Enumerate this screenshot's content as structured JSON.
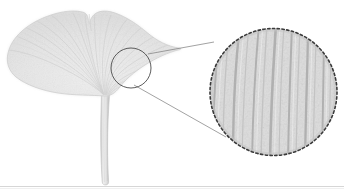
{
  "figure": {
    "caption": "Fan-shaped ginkgo leaf specimen on white background with a circular callout magnifying the dichotomous parallel venation.",
    "background_color": "#ffffff",
    "width": 344,
    "height": 194
  },
  "specimen": {
    "name": "ginkgo-leaf",
    "common_name": "Ginkgo leaf",
    "blade_fill": "#e4e4e4",
    "blade_fill_light": "#efefef",
    "blade_edge_color": "#c9c9c9",
    "vein_color": "#c4c4c4",
    "vein_color_soft": "#d4d4d4",
    "petiole_fill": "#e0e0e0",
    "petiole_edge": "#b9b9b9",
    "blade_bounds": {
      "x": 6,
      "y": 10,
      "width": 176,
      "height": 92
    },
    "petiole_bounds": {
      "x": 96,
      "y": 92,
      "width": 18,
      "height": 93
    }
  },
  "callout": {
    "source_marker": {
      "name": "detail-source-circle",
      "cx": 131,
      "cy": 68,
      "r": 20,
      "stroke": "#4a4a4a",
      "stroke_width": 0.9,
      "fill": "none"
    },
    "magnifier": {
      "name": "magnified-detail-circle",
      "cx": 273.5,
      "cy": 92,
      "r": 64,
      "stroke": "#3a3a3a",
      "stroke_dash": "2.4 2.4",
      "stroke_width": 1.6,
      "fill": "#dedede"
    },
    "leader_lines": [
      {
        "name": "leader-line-upper",
        "x1": 148,
        "y1": 54,
        "x2": 214,
        "y2": 42,
        "stroke": "#7a7a7a"
      },
      {
        "name": "leader-line-lower",
        "x1": 134,
        "y1": 85,
        "x2": 226,
        "y2": 137,
        "stroke": "#7a7a7a"
      }
    ],
    "detail_label": "Parallel dichotomous venation",
    "vein_count": 11,
    "vein_color": "#b3b3b3",
    "field_color": "#dcdcdc"
  },
  "baseline": {
    "name": "baseline-rule",
    "y": 186,
    "color": "#d6d6d6",
    "label": "specimen mount edge"
  },
  "chart_data": {
    "type": "scatter",
    "xlabel": "",
    "ylabel": "",
    "annotations": [
      "source circle on leaf blade",
      "magnified circular inset",
      "two leader lines connecting source to inset"
    ]
  }
}
